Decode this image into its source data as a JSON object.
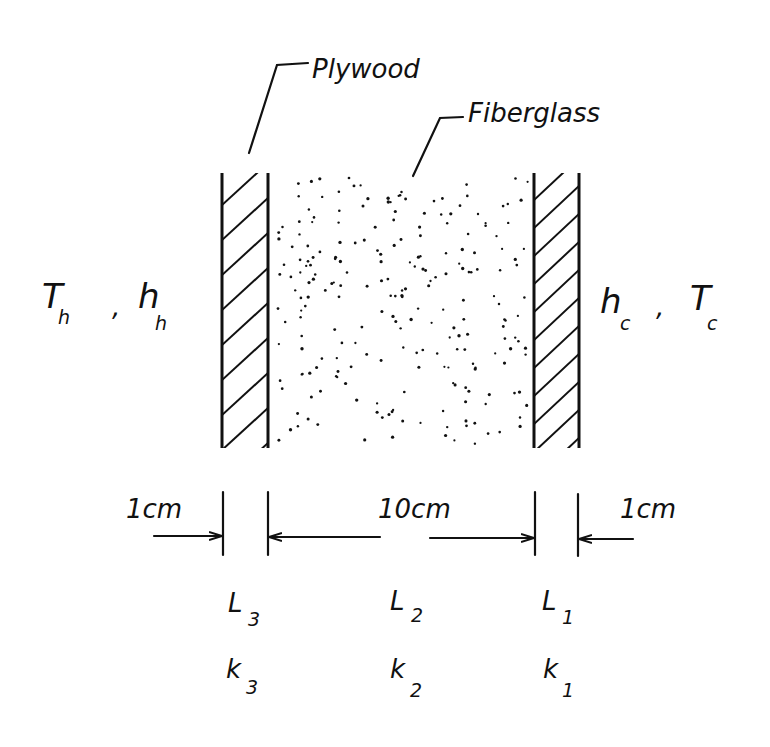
{
  "diagram": {
    "labels": {
      "plywood": "Plywood",
      "fiberglass": "Fiberglass"
    },
    "hot_side": {
      "T": "T",
      "T_sub": "h",
      "sep": ",",
      "h": "h",
      "h_sub": "h"
    },
    "cold_side": {
      "h": "h",
      "h_sub": "c",
      "sep": ",",
      "T": "T",
      "T_sub": "c"
    },
    "dimensions": {
      "left": "1cm",
      "middle": "10cm",
      "right": "1cm"
    },
    "layers": [
      {
        "L": "L",
        "L_sub": "3",
        "k": "k",
        "k_sub": "3",
        "material": "Plywood",
        "thickness": "1cm"
      },
      {
        "L": "L",
        "L_sub": "2",
        "k": "k",
        "k_sub": "2",
        "material": "Fiberglass",
        "thickness": "10cm"
      },
      {
        "L": "L",
        "L_sub": "1",
        "k": "k",
        "k_sub": "1",
        "material": "Plywood",
        "thickness": "1cm"
      }
    ],
    "colors": {
      "ink": "#111111",
      "background": "#ffffff"
    }
  }
}
